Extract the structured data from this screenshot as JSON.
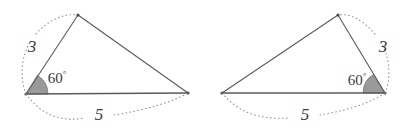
{
  "figure": {
    "stroke_color": "#5a5a5a",
    "arc_color": "#8c8c8c",
    "angle_fill": "#9a9a9a",
    "background": "#ffffff"
  },
  "triangles": [
    {
      "name": "left-triangle",
      "vertices": {
        "left": [
          26,
          94
        ],
        "apex": [
          78,
          15
        ],
        "right": [
          188,
          93
        ]
      },
      "labels": {
        "side_short": "3",
        "side_short_pos": [
          32,
          46
        ],
        "angle": "60",
        "angle_unit": "°",
        "angle_pos": [
          57,
          78
        ],
        "side_base": "5",
        "side_base_pos": [
          99,
          114
        ]
      }
    },
    {
      "name": "right-triangle",
      "vertices": {
        "left": [
          222,
          93
        ],
        "apex": [
          338,
          15
        ],
        "right": [
          385,
          93
        ]
      },
      "labels": {
        "side_short": "3",
        "side_short_pos": [
          383,
          46
        ],
        "angle": "60",
        "angle_unit": "°",
        "angle_pos": [
          357,
          80
        ],
        "side_base": "5",
        "side_base_pos": [
          305,
          114
        ]
      }
    }
  ]
}
